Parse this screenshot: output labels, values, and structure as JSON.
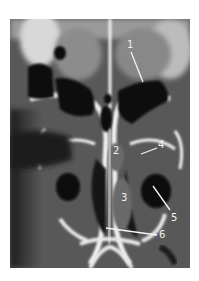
{
  "figure": {
    "background_color": "#ffffff",
    "labels": [
      {
        "id": "1",
        "text": "1",
        "x": 127,
        "y": 40
      },
      {
        "id": "2",
        "text": "2",
        "x": 113,
        "y": 146
      },
      {
        "id": "3",
        "text": "3",
        "x": 121,
        "y": 193
      },
      {
        "id": "4",
        "text": "4",
        "x": 158,
        "y": 140
      },
      {
        "id": "5",
        "text": "5",
        "x": 171,
        "y": 213
      },
      {
        "id": "6",
        "text": "6",
        "x": 159,
        "y": 230
      }
    ]
  }
}
